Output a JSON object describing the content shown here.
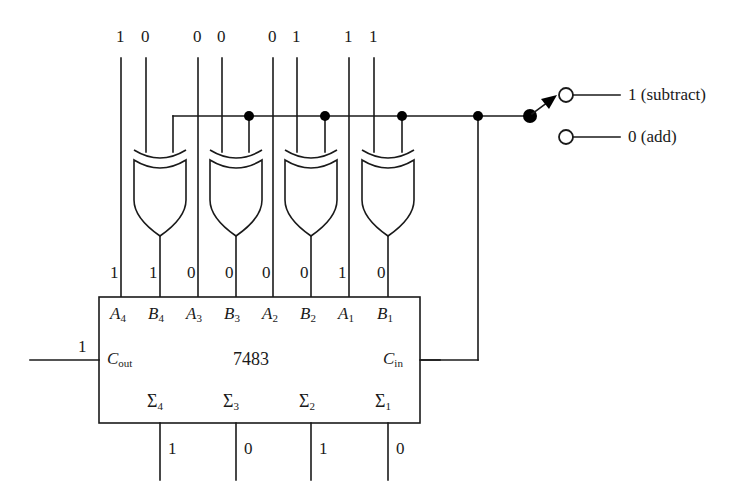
{
  "diagram": {
    "chip": {
      "name": "7483",
      "carry_out_label": "C",
      "carry_out_sub": "out",
      "carry_in_label": "C",
      "carry_in_sub": "in",
      "carry_out_value": "1"
    },
    "input_columns": [
      {
        "a_label": "A",
        "a_sub": "4",
        "b_label": "B",
        "b_sub": "4",
        "a_top_value": "1",
        "b_top_value": "0",
        "a_pin_value": "1",
        "b_pin_value": "1"
      },
      {
        "a_label": "A",
        "a_sub": "3",
        "b_label": "B",
        "b_sub": "3",
        "a_top_value": "0",
        "b_top_value": "0",
        "a_pin_value": "0",
        "b_pin_value": "0"
      },
      {
        "a_label": "A",
        "a_sub": "2",
        "b_label": "B",
        "b_sub": "2",
        "a_top_value": "0",
        "b_top_value": "1",
        "a_pin_value": "0",
        "b_pin_value": "0"
      },
      {
        "a_label": "A",
        "a_sub": "1",
        "b_label": "B",
        "b_sub": "1",
        "a_top_value": "1",
        "b_top_value": "1",
        "a_pin_value": "1",
        "b_pin_value": "0"
      }
    ],
    "sum_outputs": [
      {
        "label": "Σ",
        "sub": "4",
        "value": "1"
      },
      {
        "label": "Σ",
        "sub": "3",
        "value": "0"
      },
      {
        "label": "Σ",
        "sub": "2",
        "value": "1"
      },
      {
        "label": "Σ",
        "sub": "1",
        "value": "0"
      }
    ],
    "mode_switch": {
      "subtract_label": "1 (subtract)",
      "add_label": "0 (add)",
      "selected": "subtract"
    },
    "colors": {
      "wire": "#1a1a1a",
      "background": "#ffffff",
      "junction": "#000000"
    }
  }
}
